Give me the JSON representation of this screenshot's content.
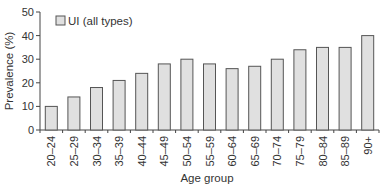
{
  "chart_data": {
    "type": "bar",
    "title": "",
    "xlabel": "Age group",
    "ylabel": "Prevalence (%)",
    "ylim": [
      0,
      50
    ],
    "yticks": [
      0,
      10,
      20,
      30,
      40,
      50
    ],
    "grid": false,
    "legend_position": "upper-left",
    "categories": [
      "20–24",
      "25–29",
      "30–34",
      "35–39",
      "40–44",
      "45–49",
      "50–54",
      "55–59",
      "60–64",
      "65–69",
      "70–74",
      "75–79",
      "80–84",
      "85–89",
      "90+"
    ],
    "series": [
      {
        "name": "UI (all types)",
        "values": [
          10,
          14,
          18,
          21,
          24,
          28,
          30,
          28,
          26,
          27,
          30,
          34,
          35,
          35,
          40
        ],
        "fill": "#e0e0e0",
        "stroke": "#555555"
      }
    ]
  }
}
